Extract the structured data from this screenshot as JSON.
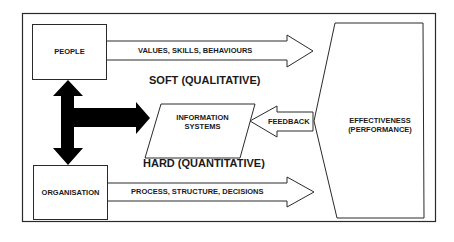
{
  "diagram": {
    "boxes": {
      "people": "PEOPLE",
      "organisation": "ORGANISATION",
      "information_systems": [
        "INFORMATION",
        "SYSTEMS"
      ],
      "effectiveness": [
        "EFFECTIVENESS",
        "(PERFORMANCE)"
      ]
    },
    "arrows": {
      "top": "VALUES, SKILLS, BEHAVIOURS",
      "bottom": "PROCESS, STRUCTURE, DECISIONS",
      "feedback": "FEEDBACK"
    },
    "headings": {
      "soft": "SOFT (QUALITATIVE)",
      "hard": "HARD (QUANTITATIVE)"
    },
    "colors": {
      "stroke": "#2a2a2a",
      "fill": "#ffffff",
      "solid_arrow": "#000000"
    }
  }
}
